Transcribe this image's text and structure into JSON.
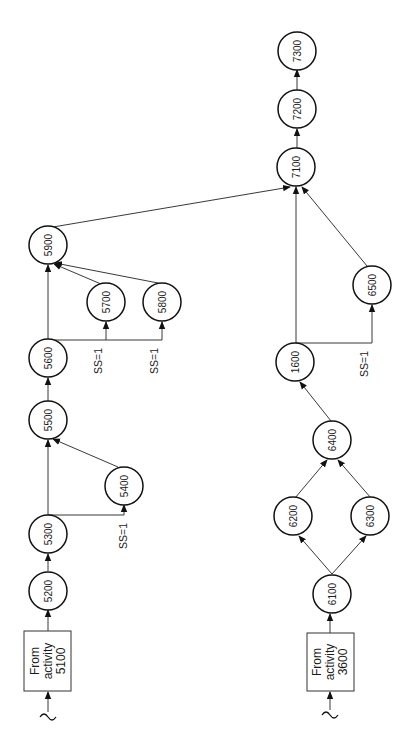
{
  "diagram": {
    "title": "",
    "orientation": "rotated-90-ccw",
    "colors": {
      "stroke": "#111111",
      "background": "#ffffff"
    },
    "sources": [
      {
        "id": "src5100",
        "lines": [
          "From",
          "activity",
          "5100"
        ]
      },
      {
        "id": "src3600",
        "lines": [
          "From",
          "activity",
          "3600"
        ]
      }
    ],
    "nodes": {
      "n5200": "5200",
      "n5300": "5300",
      "n5400": "5400",
      "n5500": "5500",
      "n5600": "5600",
      "n5700": "5700",
      "n5800": "5800",
      "n5900": "5900",
      "n6100": "6100",
      "n6200": "6200",
      "n6300": "6300",
      "n6400": "6400",
      "n1600": "1600",
      "n6500": "6500",
      "n7100": "7100",
      "n7200": "7200",
      "n7300": "7300"
    },
    "edge_labels": {
      "ss_5300_5400": "SS=1",
      "ss_5600_5700": "SS=1",
      "ss_5600_5800": "SS=1",
      "ss_1600_6500": "SS=1"
    },
    "edges": [
      [
        "From activity 5100",
        "5200"
      ],
      [
        "5200",
        "5300"
      ],
      [
        "5300",
        "5500"
      ],
      [
        "5300",
        "5400",
        "SS=1"
      ],
      [
        "5400",
        "5500"
      ],
      [
        "5500",
        "5600"
      ],
      [
        "5600",
        "5900"
      ],
      [
        "5600",
        "5700",
        "SS=1"
      ],
      [
        "5600",
        "5800",
        "SS=1"
      ],
      [
        "5700",
        "5900"
      ],
      [
        "5800",
        "5900"
      ],
      [
        "5900",
        "7100"
      ],
      [
        "From activity 3600",
        "6100"
      ],
      [
        "6100",
        "6200"
      ],
      [
        "6100",
        "6300"
      ],
      [
        "6200",
        "6400"
      ],
      [
        "6300",
        "6400"
      ],
      [
        "6400",
        "1600"
      ],
      [
        "1600",
        "7100"
      ],
      [
        "1600",
        "6500",
        "SS=1"
      ],
      [
        "6500",
        "7100"
      ],
      [
        "7100",
        "7200"
      ],
      [
        "7200",
        "7300"
      ]
    ]
  }
}
